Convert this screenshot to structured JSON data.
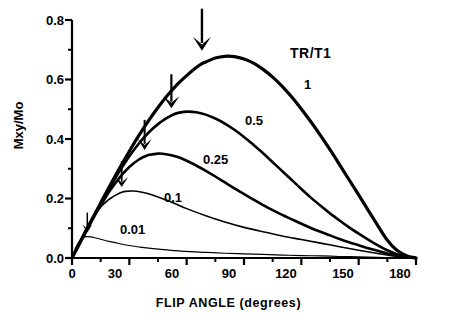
{
  "chart_data": {
    "type": "line",
    "title": "",
    "xlabel": "FLIP ANGLE (degrees)",
    "ylabel": "Mxy/Mo",
    "xlim": [
      0,
      180
    ],
    "ylim": [
      0.0,
      0.8
    ],
    "grid": false,
    "legend_position": "inside-right",
    "legend_title": "TR/T1",
    "x_ticks_major": [
      "0",
      "30",
      "60",
      "90",
      "120",
      "150",
      "180"
    ],
    "x_ticks_major_values": [
      0,
      30,
      60,
      90,
      120,
      150,
      180
    ],
    "x_ticks_minor_values": [
      15,
      45,
      75,
      105,
      135,
      165
    ],
    "y_ticks_major": [
      "0.0",
      "0.2",
      "0.4",
      "0.6",
      "0.8"
    ],
    "y_ticks_major_values": [
      0.0,
      0.2,
      0.4,
      0.6,
      0.8
    ],
    "y_ticks_minor_values": [
      0.1,
      0.3,
      0.5,
      0.7
    ],
    "series": [
      {
        "name": "1",
        "label": "1",
        "linewidth": 3.2,
        "peak": {
          "x": 68,
          "y": 0.68
        },
        "x": [
          0,
          5,
          10,
          15,
          20,
          25,
          30,
          35,
          40,
          45,
          50,
          55,
          60,
          65,
          68,
          70,
          75,
          80,
          85,
          90,
          95,
          100,
          105,
          110,
          115,
          120,
          125,
          130,
          135,
          140,
          145,
          150,
          155,
          160,
          165,
          170,
          175,
          180
        ],
        "y": [
          0.0,
          0.062,
          0.124,
          0.185,
          0.245,
          0.303,
          0.359,
          0.412,
          0.461,
          0.506,
          0.547,
          0.583,
          0.613,
          0.64,
          0.653,
          0.659,
          0.672,
          0.678,
          0.677,
          0.669,
          0.655,
          0.634,
          0.608,
          0.577,
          0.541,
          0.501,
          0.458,
          0.412,
          0.364,
          0.314,
          0.263,
          0.212,
          0.16,
          0.109,
          0.06,
          0.026,
          0.008,
          0.0
        ]
      },
      {
        "name": "0.5",
        "label": "0.5",
        "linewidth": 2.6,
        "peak": {
          "x": 52,
          "y": 0.49
        },
        "x": [
          0,
          5,
          10,
          15,
          20,
          25,
          30,
          35,
          40,
          45,
          50,
          52,
          55,
          60,
          65,
          70,
          75,
          80,
          85,
          90,
          95,
          100,
          105,
          110,
          115,
          120,
          125,
          130,
          135,
          140,
          145,
          150,
          155,
          160,
          165,
          170,
          175,
          180
        ],
        "y": [
          0.0,
          0.062,
          0.123,
          0.183,
          0.24,
          0.293,
          0.342,
          0.385,
          0.421,
          0.45,
          0.472,
          0.479,
          0.487,
          0.492,
          0.49,
          0.482,
          0.469,
          0.452,
          0.431,
          0.407,
          0.38,
          0.352,
          0.322,
          0.292,
          0.262,
          0.232,
          0.203,
          0.176,
          0.15,
          0.126,
          0.103,
          0.082,
          0.062,
          0.043,
          0.026,
          0.013,
          0.004,
          0.0
        ]
      },
      {
        "name": "0.25",
        "label": "0.25",
        "linewidth": 2.6,
        "peak": {
          "x": 38,
          "y": 0.35
        },
        "x": [
          0,
          5,
          10,
          15,
          20,
          25,
          30,
          35,
          38,
          40,
          45,
          50,
          55,
          60,
          65,
          70,
          75,
          80,
          85,
          90,
          95,
          100,
          105,
          110,
          115,
          120,
          125,
          130,
          135,
          140,
          145,
          150,
          155,
          160,
          165,
          170,
          175,
          180
        ],
        "y": [
          0.0,
          0.061,
          0.121,
          0.177,
          0.228,
          0.271,
          0.306,
          0.331,
          0.341,
          0.346,
          0.351,
          0.348,
          0.34,
          0.327,
          0.311,
          0.293,
          0.274,
          0.254,
          0.234,
          0.215,
          0.196,
          0.178,
          0.161,
          0.145,
          0.13,
          0.115,
          0.101,
          0.088,
          0.076,
          0.064,
          0.053,
          0.043,
          0.033,
          0.024,
          0.015,
          0.008,
          0.003,
          0.0
        ]
      },
      {
        "name": "0.1",
        "label": "0.1",
        "linewidth": 1.6,
        "peak": {
          "x": 26,
          "y": 0.225
        },
        "x": [
          0,
          4,
          8,
          12,
          16,
          20,
          24,
          26,
          28,
          32,
          36,
          40,
          45,
          50,
          55,
          60,
          70,
          80,
          90,
          100,
          110,
          120,
          130,
          140,
          150,
          160,
          170,
          175,
          180
        ],
        "y": [
          0.0,
          0.055,
          0.105,
          0.146,
          0.178,
          0.2,
          0.215,
          0.221,
          0.224,
          0.225,
          0.222,
          0.216,
          0.205,
          0.193,
          0.18,
          0.166,
          0.142,
          0.121,
          0.103,
          0.088,
          0.074,
          0.062,
          0.05,
          0.038,
          0.026,
          0.015,
          0.005,
          0.002,
          0.0
        ]
      },
      {
        "name": "0.01",
        "label": "0.01",
        "linewidth": 1.2,
        "peak": {
          "x": 8,
          "y": 0.072
        },
        "x": [
          0,
          2,
          4,
          6,
          8,
          10,
          12,
          15,
          20,
          25,
          30,
          35,
          40,
          50,
          60,
          70,
          80,
          90,
          100,
          110,
          120,
          130,
          140,
          150,
          160,
          170,
          175,
          180
        ],
        "y": [
          0.0,
          0.035,
          0.058,
          0.069,
          0.072,
          0.071,
          0.068,
          0.063,
          0.055,
          0.048,
          0.042,
          0.037,
          0.033,
          0.027,
          0.022,
          0.019,
          0.016,
          0.014,
          0.012,
          0.01,
          0.008,
          0.007,
          0.005,
          0.004,
          0.002,
          0.001,
          0.0005,
          0.0
        ]
      }
    ],
    "annotations": [
      {
        "kind": "arrow-down",
        "series": "1",
        "x": 68,
        "y": 0.68
      },
      {
        "kind": "arrow-down",
        "series": "0.5",
        "x": 52,
        "y": 0.49
      },
      {
        "kind": "arrow-down",
        "series": "0.25",
        "x": 38,
        "y": 0.35
      },
      {
        "kind": "arrow-down",
        "series": "0.1",
        "x": 26,
        "y": 0.225
      },
      {
        "kind": "arrow-down",
        "series": "0.01",
        "x": 8,
        "y": 0.072
      }
    ]
  },
  "labels": {
    "legend_title": "TR/T1",
    "y_axis_title": "Mxy/Mo",
    "x_axis_title": "FLIP ANGLE (degrees)",
    "y0": "0.0",
    "y1": "0.2",
    "y2": "0.4",
    "y3": "0.6",
    "y4": "0.8",
    "x0": "0",
    "x1": "30",
    "x2": "60",
    "x3": "90",
    "x4": "120",
    "x5": "150",
    "x6": "180",
    "s1": "1",
    "s2": "0.5",
    "s3": "0.25",
    "s4": "0.1",
    "s5": "0.01"
  },
  "colors": {
    "ink": "#000000",
    "background": "#ffffff"
  }
}
